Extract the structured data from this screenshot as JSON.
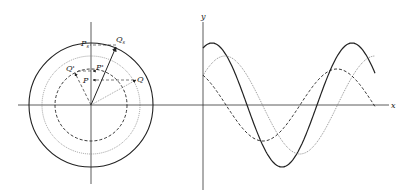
{
  "figure": {
    "phasor": {
      "center": [
        91,
        105
      ],
      "axes": {
        "x_from": 18,
        "x_to": 200,
        "y_from": 22,
        "y_to": 184
      },
      "circles": [
        {
          "name": "resultant",
          "r": 62,
          "style": "solid"
        },
        {
          "name": "wave2",
          "r": 49,
          "style": "dotted"
        },
        {
          "name": "wave1",
          "r": 36,
          "style": "dashed"
        }
      ],
      "labels": {
        "Ps": "P",
        "Ps_sub": "s",
        "Qs": "Q",
        "Qs_sub": "s",
        "Q_prime": "Q'",
        "P_prime": "P'",
        "P": "P",
        "Q": "Q"
      }
    },
    "waves": {
      "origin": [
        203,
        105
      ],
      "x_axis_end": 389,
      "y_axis_top": 22,
      "y_axis_bottom": 190,
      "axis_labels": {
        "x": "x",
        "y": "y"
      },
      "series": [
        {
          "name": "resultant",
          "style": "solid",
          "amplitude": 62,
          "period": 140,
          "peak_x": 212,
          "x_end": 375
        },
        {
          "name": "wave2",
          "style": "dotted",
          "amplitude": 49,
          "period": 150,
          "peak_x": 225,
          "x_end": 375
        },
        {
          "name": "wave1",
          "style": "dashed",
          "amplitude": 36,
          "period": 148,
          "peak_x": 337,
          "x_end": 375
        }
      ]
    }
  }
}
